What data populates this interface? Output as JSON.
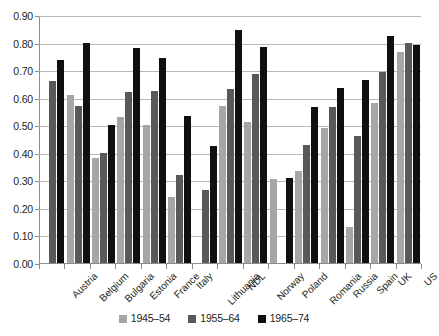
{
  "chart_data": {
    "type": "bar",
    "title": "",
    "xlabel": "",
    "ylabel": "",
    "ylim": [
      0.0,
      0.9
    ],
    "ytick_labels": [
      "0.90",
      "0.80",
      "0.70",
      "0.60",
      "0.50",
      "0.40",
      "0.30",
      "0.20",
      "0.10",
      "0.00"
    ],
    "ytick_values": [
      0.9,
      0.8,
      0.7,
      0.6,
      0.5,
      0.4,
      0.3,
      0.2,
      0.1,
      0.0
    ],
    "grid": true,
    "legend_position": "bottom",
    "categories": [
      "Austria",
      "Belgium",
      "Bulgaria",
      "Estonia",
      "France",
      "Italy",
      "Lithuania",
      "NDL",
      "Norway",
      "Poland",
      "Romania",
      "Russia",
      "Spain",
      "UK",
      "US"
    ],
    "series": [
      {
        "name": "1945-54",
        "color": "#a6a6a6",
        "values": [
          null,
          0.61,
          0.38,
          0.53,
          0.5,
          0.24,
          null,
          0.57,
          0.51,
          0.305,
          0.335,
          0.49,
          0.13,
          0.58,
          0.765
        ]
      },
      {
        "name": "1955-64",
        "color": "#595959",
        "values": [
          0.66,
          0.57,
          0.4,
          0.62,
          0.625,
          0.32,
          0.265,
          0.63,
          0.685,
          null,
          0.43,
          0.565,
          0.46,
          0.695,
          0.8
        ]
      },
      {
        "name": "1965-74",
        "color": "#101010",
        "values": [
          0.735,
          0.8,
          0.5,
          0.78,
          0.745,
          0.535,
          0.425,
          0.845,
          0.785,
          0.31,
          0.565,
          0.635,
          0.665,
          0.825,
          0.79
        ]
      }
    ]
  }
}
